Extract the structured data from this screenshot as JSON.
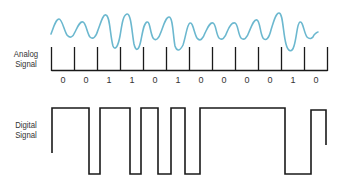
{
  "labels": {
    "analog_line1": "Analog",
    "analog_line2": "Signal",
    "digital_line1": "Digital",
    "digital_line2": "Signal"
  },
  "bits": [
    "0",
    "0",
    "1",
    "1",
    "0",
    "1",
    "0",
    "0",
    "0",
    "0",
    "1",
    "0"
  ],
  "colors": {
    "analog_wave": "#6cb8cf",
    "lines": "#1a1a1a",
    "text": "#333333",
    "background": "#ffffff"
  },
  "diagram": {
    "type": "analog-vs-digital-signal",
    "tick_count": 13,
    "bit_count": 12
  }
}
